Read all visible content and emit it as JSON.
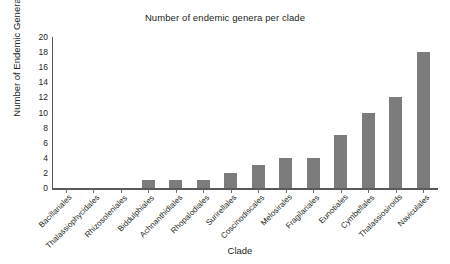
{
  "chart_data": {
    "type": "bar",
    "title": "Number of endemic genera per clade",
    "xlabel": "Clade",
    "ylabel": "Number of Endemic Genera",
    "categories": [
      "Bacillariales",
      "Thalassiophycidales",
      "Rhizosoleniales",
      "Biddulphiales",
      "Achnanthidiales",
      "Rhopalodiales",
      "Surirellales",
      "Coscinodiscales",
      "Melosirales",
      "Fragilariales",
      "Eunotiales",
      "Cymbellales",
      "Thalassiosiroids",
      "Naviculales"
    ],
    "values": [
      0,
      0,
      0,
      1,
      1,
      1,
      2,
      3,
      4,
      4,
      7,
      10,
      12,
      18
    ],
    "ylim": [
      0,
      20
    ],
    "ytick_labels": [
      "0",
      "2",
      "4",
      "6",
      "8",
      "10",
      "12",
      "14",
      "16",
      "18",
      "20"
    ],
    "ytick_values": [
      0,
      2,
      4,
      6,
      8,
      10,
      12,
      14,
      16,
      18,
      20
    ],
    "grid": false,
    "legend": false,
    "bar_color": "#7c7c7c",
    "axis_color": "#58595b",
    "text_color": "#231f20",
    "background": "#ffffff"
  }
}
